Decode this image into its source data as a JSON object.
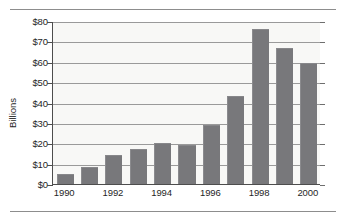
{
  "chart_data": {
    "type": "bar",
    "title": "",
    "subtitle": "",
    "xlabel": "",
    "ylabel": "Billions",
    "categories": [
      "1990",
      "1991",
      "1992",
      "1993",
      "1994",
      "1995",
      "1996",
      "1997",
      "1998",
      "1999",
      "2000"
    ],
    "values": [
      5.0,
      8.5,
      14.0,
      17.3,
      20.0,
      19.0,
      29.0,
      43.2,
      76.2,
      66.6,
      59.6
    ],
    "series": [
      {
        "name": "Billions",
        "values": [
          5.0,
          8.5,
          14.0,
          17.3,
          20.0,
          19.0,
          29.0,
          43.2,
          76.2,
          66.6,
          59.6
        ]
      }
    ],
    "ylim": [
      0,
      80
    ],
    "ytick_values": [
      0,
      10,
      20,
      30,
      40,
      50,
      60,
      70,
      80
    ],
    "ytick_labels": [
      "$0",
      "$10",
      "$20",
      "$30",
      "$40",
      "$50",
      "$60",
      "$70",
      "$80"
    ],
    "xtick_labels": [
      "1990",
      "1992",
      "1994",
      "1996",
      "1998",
      "2000"
    ],
    "xtick_categories": [
      "1990",
      "1992",
      "1994",
      "1996",
      "1998",
      "2000"
    ],
    "grid": true,
    "grid_axis": "y",
    "legend": false,
    "legend_position": "none",
    "bar_color": "#78787b",
    "plot_background": "#f8f8f6",
    "gridline_color": "#9a9a9a",
    "axis_color": "#4d4d4d",
    "text_color": "#1f1f1f",
    "annotations": []
  }
}
